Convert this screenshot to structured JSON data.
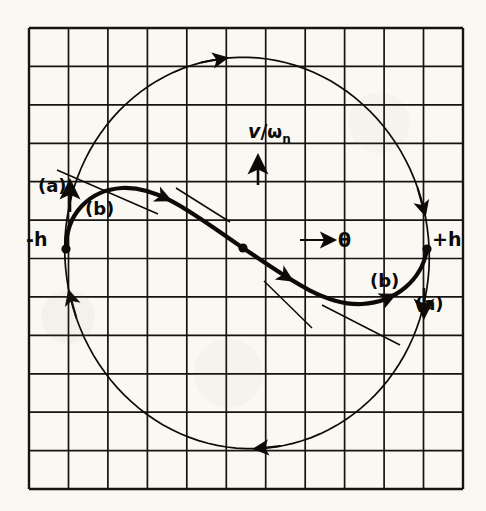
{
  "figure": {
    "kind": "phase-plane-diagram",
    "title": "",
    "background_color": "#faf8f3",
    "ink_color": "#0d0b08",
    "grid": {
      "visible": true,
      "left": 29,
      "top": 28,
      "right": 463,
      "bottom": 489,
      "columns": 11,
      "rows": 12,
      "cell_width": 39.5,
      "cell_height": 38.4,
      "line_color": "#17130f",
      "line_width": 1.7,
      "border_width": 2.4
    },
    "axes": {
      "horizontal_label": "θ",
      "horizontal_arrow": "right",
      "vertical_label_numerator": "v",
      "vertical_label_slash": "/",
      "vertical_label_denominator": "ω",
      "vertical_label_subscript": "n",
      "vertical_arrow": "up",
      "origin_x": 243,
      "origin_y": 248
    },
    "points": [
      {
        "name": "minus-h",
        "label": "-h",
        "x": 66,
        "y": 249
      },
      {
        "name": "plus-h",
        "label": "+h",
        "x": 427,
        "y": 249
      },
      {
        "name": "origin",
        "label": "",
        "x": 243,
        "y": 248
      }
    ],
    "curve_labels": [
      {
        "name": "a-left",
        "label": "(a)"
      },
      {
        "name": "b-left",
        "label": "(b)"
      },
      {
        "name": "b-right",
        "label": "(b)"
      },
      {
        "name": "a-right",
        "label": "(a)"
      }
    ],
    "curves": {
      "limit_cycle": {
        "name": "limit-cycle-circle",
        "description": "large closed orbit traversed clockwise",
        "center_x": 247,
        "center_y": 253,
        "radius_x": 182,
        "radius_y": 196,
        "rotation_deg": -8,
        "direction": "clockwise",
        "stroke_width": 1.7,
        "arrow_positions_deg": [
          268,
          92,
          352,
          172
        ]
      },
      "switching_curve": {
        "name": "switching-trajectory",
        "description": "heavy S-shaped separatrix from -h through origin to +h",
        "stroke_width": 4.2,
        "path": "M 66 249 C 66 213 90 190 122 188 C 160 186 196 216 243 248 C 290 280 326 306 362 304 C 396 302 422 280 427 249"
      }
    },
    "tangent_segments": [
      {
        "name": "tangent-upper-left",
        "x1": 57,
        "y1": 170,
        "x2": 158,
        "y2": 214
      },
      {
        "name": "tangent-upper-mid",
        "x1": 176,
        "y1": 188,
        "x2": 230,
        "y2": 222
      },
      {
        "name": "tangent-lower-mid",
        "x1": 264,
        "y1": 281,
        "x2": 312,
        "y2": 328
      },
      {
        "name": "tangent-lower-right",
        "x1": 322,
        "y1": 305,
        "x2": 400,
        "y2": 345
      }
    ]
  }
}
